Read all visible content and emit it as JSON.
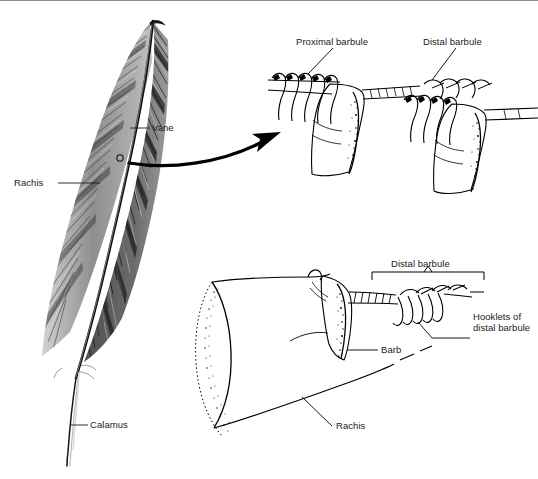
{
  "figure": {
    "background_color": "#ffffff",
    "ink_color": "#000000",
    "frame_line_color": "#8d8d8d"
  },
  "labels": {
    "vane": "Vane",
    "rachis_main": "Rachis",
    "calamus": "Calamus",
    "proximal_barbule": "Proximal barbule",
    "distal_barbule_top": "Distal barbule",
    "distal_barbule_bottom": "Distal barbule",
    "hooklets_line1": "Hooklets of",
    "hooklets_line2": "distal barbule",
    "barb": "Barb",
    "rachis_detail": "Rachis"
  },
  "panels": {
    "whole_feather": {
      "name": "whole-feather-illustration",
      "parts": [
        "Vane",
        "Rachis",
        "Calamus"
      ],
      "magnifier_marker": "small-circle-on-vane"
    },
    "barbule_interlock": {
      "name": "barbule-interlock-detail",
      "parts": [
        "Proximal barbule",
        "Distal barbule"
      ]
    },
    "barb_section": {
      "name": "barb-rachis-detail",
      "parts": [
        "Distal barbule",
        "Hooklets of distal barbule",
        "Barb",
        "Rachis"
      ]
    }
  },
  "callout_arrow": {
    "from": "feather-vane-marker",
    "to": "barbule-interlock-detail"
  }
}
